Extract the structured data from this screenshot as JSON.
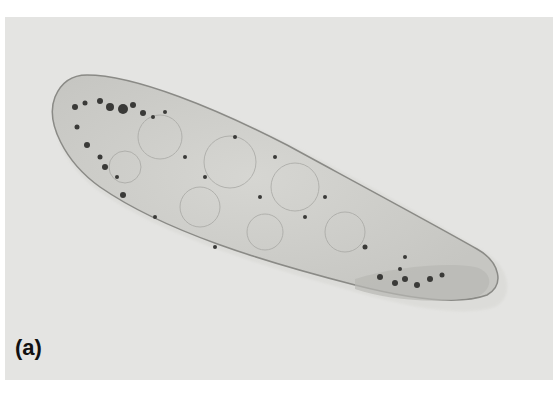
{
  "figure": {
    "panel_label": "(a)",
    "colors": {
      "background": "#e4e4e2",
      "cell_body": "#cfcfcb",
      "outline": "#8a8a86",
      "granules": "#3a3a38"
    }
  }
}
